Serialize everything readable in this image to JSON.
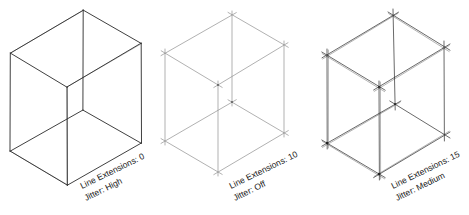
{
  "figure": {
    "panels": [
      {
        "id": "panel-1",
        "line_extensions_label": "Line Extensions: 0",
        "jitter_label": "Jitter: High",
        "line_extensions": 0,
        "jitter": "High",
        "stroke_color": "#2a2a2a"
      },
      {
        "id": "panel-2",
        "line_extensions_label": "Line Extensions: 10",
        "jitter_label": "Jitter: Off",
        "line_extensions": 10,
        "jitter": "Off",
        "stroke_color": "#8a8a8a"
      },
      {
        "id": "panel-3",
        "line_extensions_label": "Line Extensions: 15",
        "jitter_label": "Jitter: Medium",
        "line_extensions": 15,
        "jitter": "Medium",
        "stroke_color": "#2a2a2a"
      }
    ]
  }
}
